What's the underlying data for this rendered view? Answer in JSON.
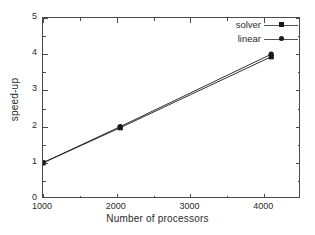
{
  "chart_data": {
    "type": "line",
    "title": "",
    "xlabel": "Number of processors",
    "ylabel": "speed-up",
    "xlim": [
      1000,
      4500
    ],
    "ylim": [
      0,
      5
    ],
    "grid": false,
    "legend_position": "top-right",
    "xticks": [
      1000,
      2000,
      3000,
      4000
    ],
    "xtick_labels": [
      "1000",
      "2000",
      "3000",
      "4000"
    ],
    "xminor_ticks": [
      1500,
      2500,
      3500,
      4500
    ],
    "yticks": [
      0,
      1,
      2,
      3,
      4,
      5
    ],
    "ytick_labels": [
      "0",
      "1",
      "2",
      "3",
      "4",
      "5"
    ],
    "yminor_ticks": [
      0.5,
      1.5,
      2.5,
      3.5,
      4.5
    ],
    "series": [
      {
        "name": "solver",
        "marker": "square",
        "color": "#1a1a1a",
        "x": [
          1000,
          2048,
          4096
        ],
        "values": [
          1.0,
          1.97,
          3.93
        ]
      },
      {
        "name": "linear",
        "marker": "circle",
        "color": "#1a1a1a",
        "x": [
          1000,
          2048,
          4096
        ],
        "values": [
          1.0,
          2.0,
          4.0
        ]
      }
    ]
  },
  "axes": {
    "x_title": "Number of processors",
    "y_title": "speed-up"
  },
  "legend": {
    "entries": [
      {
        "label": "solver",
        "marker": "square"
      },
      {
        "label": "linear",
        "marker": "circle"
      }
    ]
  }
}
